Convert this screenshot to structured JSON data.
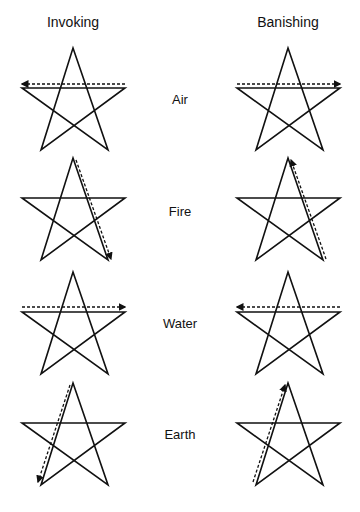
{
  "headers": {
    "invoking": "Invoking",
    "banishing": "Banishing"
  },
  "elements": [
    {
      "name": "Air",
      "label_y": 92
    },
    {
      "name": "Fire",
      "label_y": 204
    },
    {
      "name": "Water",
      "label_y": 316
    },
    {
      "name": "Earth",
      "label_y": 427
    }
  ],
  "stars": [
    {
      "element": "Air",
      "column": "invoking",
      "top": 48,
      "trace": "horizontal",
      "direction": "right-to-left"
    },
    {
      "element": "Air",
      "column": "banishing",
      "top": 48,
      "trace": "horizontal",
      "direction": "left-to-right"
    },
    {
      "element": "Fire",
      "column": "invoking",
      "top": 158,
      "trace": "top-to-bottom-right",
      "direction": "downward"
    },
    {
      "element": "Fire",
      "column": "banishing",
      "top": 158,
      "trace": "bottom-right-to-top",
      "direction": "upward"
    },
    {
      "element": "Water",
      "column": "invoking",
      "top": 272,
      "trace": "horizontal",
      "direction": "left-to-right"
    },
    {
      "element": "Water",
      "column": "banishing",
      "top": 272,
      "trace": "horizontal",
      "direction": "right-to-left"
    },
    {
      "element": "Earth",
      "column": "invoking",
      "top": 383,
      "trace": "top-to-bottom-left",
      "direction": "downward"
    },
    {
      "element": "Earth",
      "column": "banishing",
      "top": 383,
      "trace": "bottom-left-to-top",
      "direction": "upward"
    }
  ],
  "colors": {
    "line": "#111111",
    "background": "#ffffff"
  }
}
